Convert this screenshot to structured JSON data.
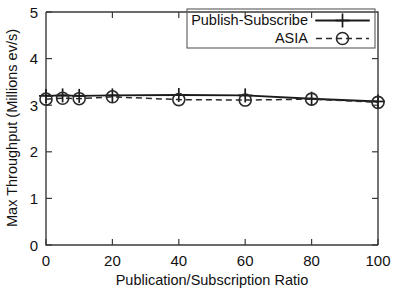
{
  "chart_data": {
    "type": "line",
    "title": "",
    "xlabel": "Publication/Subscription Ratio",
    "ylabel": "Max Throughput (Millions ev/s)",
    "xlim": [
      0,
      100
    ],
    "ylim": [
      0,
      5
    ],
    "xticks": [
      "0",
      "20",
      "40",
      "60",
      "80",
      "100"
    ],
    "xtick_values": [
      0,
      20,
      40,
      60,
      80,
      100
    ],
    "yticks": [
      "0",
      "1",
      "2",
      "3",
      "4",
      "5"
    ],
    "ytick_values": [
      0,
      1,
      2,
      3,
      4,
      5
    ],
    "grid": false,
    "legend_position": "top-right",
    "x": [
      0,
      5,
      10,
      20,
      40,
      60,
      80,
      100
    ],
    "series": [
      {
        "name": "Publish-Subscribe",
        "marker": "plus",
        "linestyle": "solid",
        "color": "#1a1a1a",
        "values": [
          3.2,
          3.21,
          3.2,
          3.21,
          3.22,
          3.21,
          3.14,
          3.08
        ]
      },
      {
        "name": "ASIA",
        "marker": "circle",
        "linestyle": "dashed",
        "color": "#2a2a2a",
        "values": [
          3.13,
          3.15,
          3.14,
          3.18,
          3.12,
          3.11,
          3.13,
          3.06
        ]
      }
    ]
  },
  "legend": {
    "entries": [
      {
        "label": "Publish-Subscribe"
      },
      {
        "label": "ASIA"
      }
    ]
  },
  "axes": {
    "x_title": "Publication/Subscription Ratio",
    "y_title": "Max Throughput (Millions ev/s)"
  }
}
